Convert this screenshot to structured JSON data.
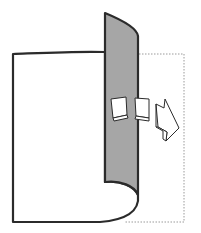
{
  "diagram": {
    "colors": {
      "background": "#ffffff",
      "outline": "#2b2b2b",
      "page_fill": "#ffffff",
      "page_back_fill": "#a6a6a6",
      "dashed_outline": "#9a9a9a",
      "arrow_fill": "#ffffff"
    },
    "elements": [
      {
        "id": "left-page",
        "label": ""
      },
      {
        "id": "curled-page-back",
        "label": ""
      },
      {
        "id": "next-page-outline",
        "label": ""
      },
      {
        "id": "turn-arrow",
        "label": ""
      }
    ]
  }
}
